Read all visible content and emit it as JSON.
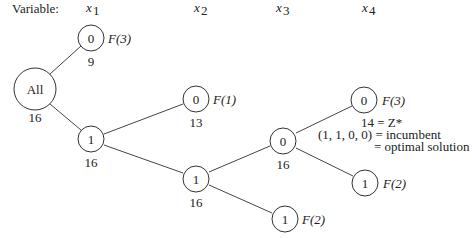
{
  "header": {
    "variable_label": "Variable:",
    "columns": [
      {
        "var": "x",
        "sub": "1"
      },
      {
        "var": "x",
        "sub": "2"
      },
      {
        "var": "x",
        "sub": "3"
      },
      {
        "var": "x",
        "sub": "4"
      }
    ]
  },
  "nodes": {
    "root": {
      "label": "All",
      "bound": "16"
    },
    "x1_0": {
      "label": "0",
      "bound": "9",
      "status": "F(3)"
    },
    "x1_1": {
      "label": "1",
      "bound": "16"
    },
    "x2_0": {
      "label": "0",
      "bound": "13",
      "status": "F(1)"
    },
    "x2_1": {
      "label": "1",
      "bound": "16"
    },
    "x3_0": {
      "label": "0",
      "bound": "16"
    },
    "x3_1": {
      "label": "1",
      "status": "F(2)"
    },
    "x4_0": {
      "label": "0",
      "status": "F(3)"
    },
    "x4_1": {
      "label": "1",
      "status": "F(2)"
    }
  },
  "annotation": {
    "line1": "14 = Z*",
    "line2": "(1, 1, 0, 0) = incumbent",
    "line3": "= optimal solution"
  }
}
